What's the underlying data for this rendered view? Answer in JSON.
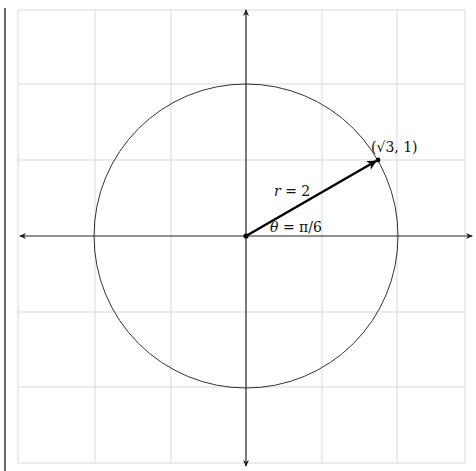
{
  "diagram": {
    "colors": {
      "background": "#ffffff",
      "grid": "#d9d9d9",
      "axis": "#222222",
      "circle": "#333333",
      "vector": "#000000",
      "left_rule": "#444444"
    },
    "grid": {
      "x_lines": [
        18,
        95,
        171,
        246,
        322,
        397,
        465
      ],
      "y_lines": [
        10,
        84,
        160,
        236,
        312,
        387,
        463
      ],
      "unit_px": 76
    },
    "origin": {
      "x": 246,
      "y": 236
    },
    "circle": {
      "radius_units": 2,
      "radius_px": 152
    },
    "vector": {
      "from": [
        0,
        0
      ],
      "to": [
        1.732,
        1
      ],
      "end_px": {
        "x": 378,
        "y": 160
      }
    },
    "labels": {
      "point": "(√3, 1)",
      "radius_var": "r",
      "radius_eq": " = 2",
      "angle_var": "θ",
      "angle_eq": " = π/6"
    }
  }
}
